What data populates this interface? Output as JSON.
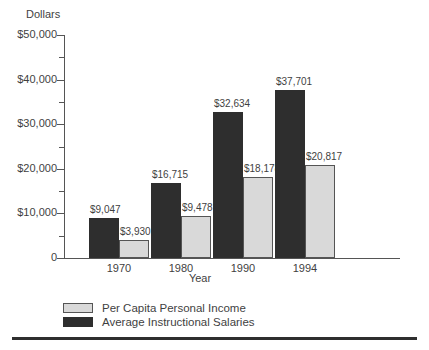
{
  "chart_data": {
    "type": "bar",
    "title": "",
    "subtitle": "",
    "xlabel": "Year",
    "ylabel": "Dollars",
    "categories": [
      "1970",
      "1980",
      "1990",
      "1994"
    ],
    "series": [
      {
        "name": "Average Instructional Salaries",
        "color": "#2e2e2e",
        "values": [
          9047,
          16715,
          32634,
          37701
        ],
        "labels": [
          "$9,047",
          "$16,715",
          "$32,634",
          "$37,701"
        ]
      },
      {
        "name": "Per Capita Personal Income",
        "color": "#d9d9d9",
        "values": [
          3930,
          9478,
          18178,
          20817
        ],
        "labels": [
          "$3,930",
          "$9,478",
          "$18,178",
          "$20,817"
        ]
      }
    ],
    "ylim": [
      0,
      50000
    ],
    "ytick_values": [
      0,
      10000,
      20000,
      30000,
      40000,
      50000
    ],
    "ytick_labels": [
      "0",
      "$10,000",
      "$20,000",
      "$30,000",
      "$40,000",
      "$50,000"
    ],
    "yminor_tick_values": [
      5000,
      15000,
      25000,
      35000,
      45000
    ],
    "grid": false,
    "legend_position": "bottom-left",
    "legend_order": [
      "Per Capita Personal Income",
      "Average Instructional Salaries"
    ]
  },
  "legend": {
    "items": [
      {
        "label": "Per Capita Personal Income",
        "swatch": "light"
      },
      {
        "label": "Average Instructional Salaries",
        "swatch": "dark"
      }
    ]
  },
  "colors": {
    "dark_bar": "#2e2e2e",
    "light_bar": "#d9d9d9",
    "axis": "#555555",
    "text": "#3f3f3f",
    "rule": "#2f2f2f",
    "background": "#ffffff"
  }
}
